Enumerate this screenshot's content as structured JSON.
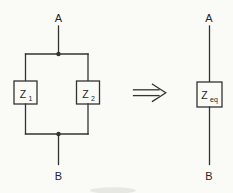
{
  "diagram": {
    "parallel_circuit": {
      "terminal_top": "A",
      "terminal_bottom": "B",
      "z1": {
        "base": "Z",
        "sub": "1"
      },
      "z2": {
        "base": "Z",
        "sub": "2"
      }
    },
    "equivalent_circuit": {
      "terminal_top": "A",
      "terminal_bottom": "B",
      "zeq": {
        "base": "Z",
        "sub": "eq"
      }
    },
    "colors": {
      "line": "#333333",
      "text": "#262626",
      "background": "#fafaf7"
    }
  }
}
